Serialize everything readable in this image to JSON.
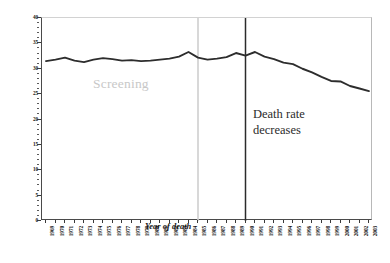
{
  "chart_data": {
    "type": "line",
    "title": "",
    "xlabel": "Year of death",
    "ylabel": "Rate per 100,000",
    "ylim": [
      0,
      40
    ],
    "ytick_step": 5,
    "yticks": [
      0,
      5,
      10,
      15,
      20,
      25,
      30,
      35,
      40
    ],
    "grid": false,
    "legend": "none",
    "line_color": "#2d2d2d",
    "categories": [
      "1969",
      "1970",
      "1971",
      "1972",
      "1973",
      "1974",
      "1975",
      "1976",
      "1977",
      "1978",
      "1979",
      "1980",
      "1981",
      "1982",
      "1983",
      "1984",
      "1985",
      "1986",
      "1987",
      "1988",
      "1989",
      "1990",
      "1991",
      "1992",
      "1993",
      "1994",
      "1995",
      "1996",
      "1997",
      "1998",
      "1999",
      "2000",
      "2001",
      "2002",
      "2003"
    ],
    "series": [
      {
        "name": "Breast cancer death rate",
        "values": [
          31.5,
          31.8,
          32.2,
          31.6,
          31.3,
          31.8,
          32.1,
          31.9,
          31.6,
          31.7,
          31.5,
          31.6,
          31.8,
          32.0,
          32.4,
          33.3,
          32.2,
          31.8,
          32.0,
          32.3,
          33.1,
          32.6,
          33.3,
          32.4,
          31.9,
          31.2,
          30.9,
          30.0,
          29.3,
          28.4,
          27.6,
          27.5,
          26.6,
          26.1,
          25.6
        ]
      }
    ],
    "annotations": [
      {
        "name": "screening-label",
        "text": "Screening",
        "color": "#c8c8c8",
        "x_year": "1977"
      },
      {
        "name": "death-rate-label",
        "line1": "Death rate",
        "line2": "decreases",
        "color": "#2b2b2b",
        "x_year": "1992"
      }
    ],
    "vlines": [
      {
        "name": "screening-start-line",
        "x_year": "1985",
        "color": "#cfcfcf"
      },
      {
        "name": "death-rate-decline-line",
        "x_year": "1990",
        "color": "#2b2b2b"
      }
    ]
  }
}
